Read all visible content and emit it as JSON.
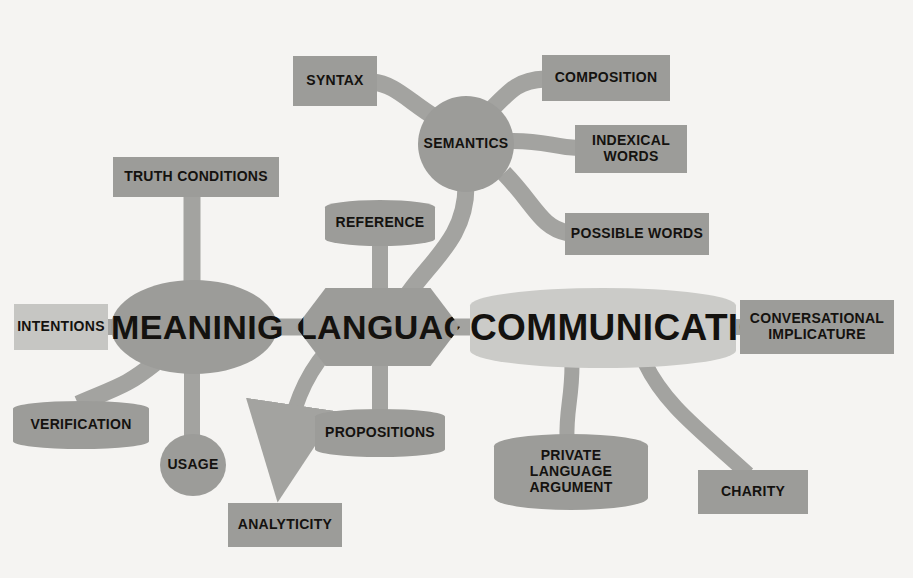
{
  "diagram": {
    "type": "mind-map",
    "background_color": "#f5f4f2",
    "palette": {
      "node_gray": "#9c9c99",
      "node_light_gray": "#c6c6c3",
      "hub_light_gray": "#cbcbc8",
      "connector_gray": "#a3a3a0",
      "text_color": "#14120f"
    }
  },
  "nodes": {
    "semantics": {
      "label": "SEMANTICS",
      "shape": "circle"
    },
    "syntax": {
      "label": "SYNTAX",
      "shape": "rect"
    },
    "composition": {
      "label": "COMPOSITION",
      "shape": "rect"
    },
    "indexical_words": {
      "label": "INDEXICAL\nWORDS",
      "shape": "rect"
    },
    "possible_words": {
      "label": "POSSIBLE WORDS",
      "shape": "rect"
    },
    "reference": {
      "label": "REFERENCE",
      "shape": "barrel"
    },
    "truth_conditions": {
      "label": "TRUTH CONDITIONS",
      "shape": "rect"
    },
    "intentions": {
      "label": "INTENTIONS",
      "shape": "rect-light"
    },
    "meaning": {
      "label": "MEANINIG",
      "shape": "ellipse"
    },
    "language": {
      "label": "LANGUAGE",
      "shape": "diamond"
    },
    "communication": {
      "label": "COMMUNICATION",
      "shape": "barrel-big"
    },
    "conversational_implicature": {
      "label": "CONVERSATIONAL\nIMPLICATURE",
      "shape": "rect"
    },
    "verification": {
      "label": "VERIFICATION",
      "shape": "barrel"
    },
    "usage": {
      "label": "USAGE",
      "shape": "ellipse"
    },
    "analyticity": {
      "label": "ANALYTICITY",
      "shape": "rect"
    },
    "propositions": {
      "label": "PROPOSITIONS",
      "shape": "barrel"
    },
    "private_language_argument": {
      "label": "PRIVATE\nLANGUAGE\nARGUMENT",
      "shape": "barrel"
    },
    "charity": {
      "label": "CHARITY",
      "shape": "rect"
    }
  },
  "edges": [
    {
      "from": "semantics",
      "to": "syntax",
      "style": "curve"
    },
    {
      "from": "semantics",
      "to": "composition",
      "style": "curve"
    },
    {
      "from": "semantics",
      "to": "indexical_words",
      "style": "curve"
    },
    {
      "from": "semantics",
      "to": "possible_words",
      "style": "curve"
    },
    {
      "from": "semantics",
      "to": "language",
      "style": "curve"
    },
    {
      "from": "truth_conditions",
      "to": "meaning",
      "style": "straight"
    },
    {
      "from": "intentions",
      "to": "meaning",
      "style": "straight"
    },
    {
      "from": "meaning",
      "to": "language",
      "style": "straight"
    },
    {
      "from": "meaning",
      "to": "verification",
      "style": "curve"
    },
    {
      "from": "meaning",
      "to": "usage",
      "style": "straight"
    },
    {
      "from": "reference",
      "to": "language",
      "style": "straight"
    },
    {
      "from": "language",
      "to": "propositions",
      "style": "straight"
    },
    {
      "from": "language",
      "to": "analyticity",
      "style": "arrow"
    },
    {
      "from": "language",
      "to": "communication",
      "style": "straight"
    },
    {
      "from": "communication",
      "to": "conversational_implicature",
      "style": "straight"
    },
    {
      "from": "communication",
      "to": "private_language_argument",
      "style": "curve"
    },
    {
      "from": "communication",
      "to": "charity",
      "style": "curve"
    }
  ]
}
